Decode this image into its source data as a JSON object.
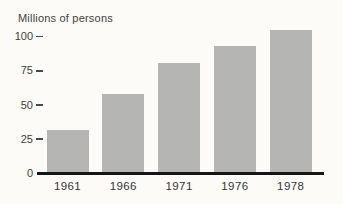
{
  "figure": {
    "title": "Millions of persons"
  },
  "chart_data": {
    "type": "bar",
    "title": "Millions of persons",
    "categories": [
      "1961",
      "1966",
      "1971",
      "1976",
      "1978"
    ],
    "values": [
      32,
      58,
      81,
      93,
      105
    ],
    "xlabel": "",
    "ylabel": "Millions of persons",
    "ylim": [
      0,
      110
    ],
    "yticks": [
      0,
      25,
      50,
      75,
      100
    ],
    "grid": false,
    "legend": false,
    "bar_color": "#b5b5b3",
    "background_color": "#fcfbf8",
    "axis_color": "#161616",
    "text_color": "#3d3d3d"
  }
}
